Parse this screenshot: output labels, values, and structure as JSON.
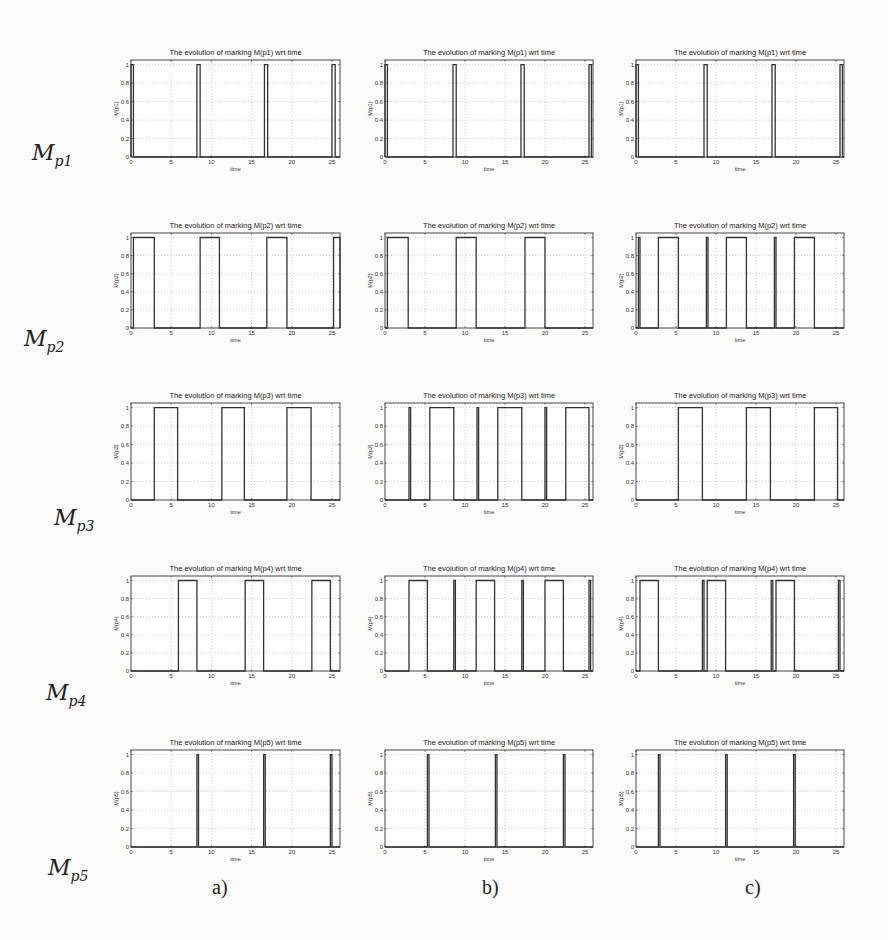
{
  "figure": {
    "row_labels": [
      {
        "base": "M",
        "sub": "p1"
      },
      {
        "base": "M",
        "sub": "p2"
      },
      {
        "base": "M",
        "sub": "p3"
      },
      {
        "base": "M",
        "sub": "p4"
      },
      {
        "base": "M",
        "sub": "p5"
      }
    ],
    "col_labels": [
      "a)",
      "b)",
      "c)"
    ]
  },
  "chart_data": [
    {
      "type": "line",
      "row": 0,
      "col": 0,
      "title": "The evolution of marking M(p1) wrt time",
      "xlabel": "time",
      "ylabel": "M(p1)",
      "xlim": [
        0,
        26
      ],
      "ylim": [
        0,
        1.05
      ],
      "xticks": [
        0,
        5,
        10,
        15,
        20,
        25
      ],
      "xtick_labels": [
        "0",
        "5",
        "10",
        "15",
        "20",
        "25"
      ],
      "yticks": [
        0,
        0.2,
        0.4,
        0.6,
        0.8,
        1
      ],
      "ytick_labels": [
        "0",
        "0.2",
        "0.4",
        "0.6",
        "0.8",
        "1"
      ],
      "grid": true,
      "pulses": [
        [
          0,
          0.3
        ],
        [
          8.2,
          8.6
        ],
        [
          16.6,
          17.0
        ],
        [
          25.0,
          25.4
        ]
      ]
    },
    {
      "type": "line",
      "row": 0,
      "col": 1,
      "title": "The evolution of marking M(p1) wrt time",
      "xlabel": "time",
      "ylabel": "M(p1)",
      "xlim": [
        0,
        26
      ],
      "ylim": [
        0,
        1.05
      ],
      "xticks": [
        0,
        5,
        10,
        15,
        20,
        25
      ],
      "xtick_labels": [
        "0",
        "5",
        "10",
        "15",
        "20",
        "25"
      ],
      "yticks": [
        0,
        0.2,
        0.4,
        0.6,
        0.8,
        1
      ],
      "ytick_labels": [
        "0",
        "0.2",
        "0.4",
        "0.6",
        "0.8",
        "1"
      ],
      "grid": true,
      "pulses": [
        [
          0,
          0.3
        ],
        [
          8.5,
          8.9
        ],
        [
          17.0,
          17.4
        ],
        [
          25.5,
          25.8
        ]
      ]
    },
    {
      "type": "line",
      "row": 0,
      "col": 2,
      "title": "The evolution of marking M(p1) wrt time",
      "xlabel": "time",
      "ylabel": "M(p1)",
      "xlim": [
        0,
        26
      ],
      "ylim": [
        0,
        1.05
      ],
      "xticks": [
        0,
        5,
        10,
        15,
        20,
        25
      ],
      "xtick_labels": [
        "0",
        "5",
        "10",
        "15",
        "20",
        "25"
      ],
      "yticks": [
        0,
        0.2,
        0.4,
        0.6,
        0.8,
        1
      ],
      "ytick_labels": [
        "0",
        "0.2",
        "0.4",
        "0.6",
        "0.8",
        "1"
      ],
      "grid": true,
      "pulses": [
        [
          0,
          0.3
        ],
        [
          8.5,
          8.9
        ],
        [
          17.0,
          17.4
        ],
        [
          25.5,
          25.8
        ]
      ]
    },
    {
      "type": "line",
      "row": 1,
      "col": 0,
      "title": "The evolution of marking M(p2) wrt time",
      "xlabel": "time",
      "ylabel": "M(p2)",
      "xlim": [
        0,
        26
      ],
      "ylim": [
        0,
        1.05
      ],
      "xticks": [
        0,
        5,
        10,
        15,
        20,
        25
      ],
      "xtick_labels": [
        "0",
        "5",
        "10",
        "15",
        "20",
        "25"
      ],
      "yticks": [
        0,
        0.2,
        0.4,
        0.6,
        0.8,
        1
      ],
      "ytick_labels": [
        "0",
        "0.2",
        "0.4",
        "0.6",
        "0.8",
        "1"
      ],
      "grid": true,
      "pulses": [
        [
          0.3,
          2.9
        ],
        [
          8.6,
          11.0
        ],
        [
          16.9,
          19.4
        ],
        [
          25.2,
          26
        ]
      ]
    },
    {
      "type": "line",
      "row": 1,
      "col": 1,
      "title": "The evolution of marking M(p2) wrt time",
      "xlabel": "time",
      "ylabel": "M(p2)",
      "xlim": [
        0,
        26
      ],
      "ylim": [
        0,
        1.05
      ],
      "xticks": [
        0,
        5,
        10,
        15,
        20,
        25
      ],
      "xtick_labels": [
        "0",
        "5",
        "10",
        "15",
        "20",
        "25"
      ],
      "yticks": [
        0,
        0.2,
        0.4,
        0.6,
        0.8,
        1
      ],
      "ytick_labels": [
        "0",
        "0.2",
        "0.4",
        "0.6",
        "0.8",
        "1"
      ],
      "grid": true,
      "pulses": [
        [
          0.3,
          2.9
        ],
        [
          8.9,
          11.4
        ],
        [
          17.5,
          20.0
        ]
      ]
    },
    {
      "type": "line",
      "row": 1,
      "col": 2,
      "title": "The evolution of marking M(p2) wrt time",
      "xlabel": "time",
      "ylabel": "M(p2)",
      "xlim": [
        0,
        26
      ],
      "ylim": [
        0,
        1.05
      ],
      "xticks": [
        0,
        5,
        10,
        15,
        20,
        25
      ],
      "xtick_labels": [
        "0",
        "5",
        "10",
        "15",
        "20",
        "25"
      ],
      "yticks": [
        0,
        0.2,
        0.4,
        0.6,
        0.8,
        1
      ],
      "ytick_labels": [
        "0",
        "0.2",
        "0.4",
        "0.6",
        "0.8",
        "1"
      ],
      "grid": true,
      "pulses": [
        [
          0.3,
          0.5
        ],
        [
          2.8,
          5.3
        ],
        [
          8.8,
          9.0
        ],
        [
          11.3,
          13.8
        ],
        [
          17.3,
          17.5
        ],
        [
          19.8,
          22.3
        ]
      ]
    },
    {
      "type": "line",
      "row": 2,
      "col": 0,
      "title": "The evolution of marking M(p3) wrt time",
      "xlabel": "time",
      "ylabel": "M(p3)",
      "xlim": [
        0,
        26
      ],
      "ylim": [
        0,
        1.05
      ],
      "xticks": [
        0,
        5,
        10,
        15,
        20,
        25
      ],
      "xtick_labels": [
        "0",
        "5",
        "10",
        "15",
        "20",
        "25"
      ],
      "yticks": [
        0,
        0.2,
        0.4,
        0.6,
        0.8,
        1
      ],
      "ytick_labels": [
        "0",
        "0.2",
        "0.4",
        "0.6",
        "0.8",
        "1"
      ],
      "grid": true,
      "pulses": [
        [
          2.9,
          5.8
        ],
        [
          11.3,
          14.1
        ],
        [
          19.4,
          22.4
        ]
      ]
    },
    {
      "type": "line",
      "row": 2,
      "col": 1,
      "title": "The evolution of marking M(p3) wrt time",
      "xlabel": "time",
      "ylabel": "M(p3)",
      "xlim": [
        0,
        26
      ],
      "ylim": [
        0,
        1.05
      ],
      "xticks": [
        0,
        5,
        10,
        15,
        20,
        25
      ],
      "xtick_labels": [
        "0",
        "5",
        "10",
        "15",
        "20",
        "25"
      ],
      "yticks": [
        0,
        0.2,
        0.4,
        0.6,
        0.8,
        1
      ],
      "ytick_labels": [
        "0",
        "0.2",
        "0.4",
        "0.6",
        "0.8",
        "1"
      ],
      "grid": true,
      "pulses": [
        [
          3.0,
          3.2
        ],
        [
          5.6,
          8.6
        ],
        [
          11.5,
          11.7
        ],
        [
          14.1,
          17.1
        ],
        [
          20.0,
          20.2
        ],
        [
          22.6,
          25.5
        ]
      ]
    },
    {
      "type": "line",
      "row": 2,
      "col": 2,
      "title": "The evolution of marking M(p3) wrt time",
      "xlabel": "time",
      "ylabel": "M(p3)",
      "xlim": [
        0,
        26
      ],
      "ylim": [
        0,
        1.05
      ],
      "xticks": [
        0,
        5,
        10,
        15,
        20,
        25
      ],
      "xtick_labels": [
        "0",
        "5",
        "10",
        "15",
        "20",
        "25"
      ],
      "yticks": [
        0,
        0.2,
        0.4,
        0.6,
        0.8,
        1
      ],
      "ytick_labels": [
        "0",
        "0.2",
        "0.4",
        "0.6",
        "0.8",
        "1"
      ],
      "grid": true,
      "pulses": [
        [
          5.3,
          8.3
        ],
        [
          13.8,
          16.8
        ],
        [
          22.3,
          25.2
        ]
      ]
    },
    {
      "type": "line",
      "row": 3,
      "col": 0,
      "title": "The evolution of marking M(p4) wrt time",
      "xlabel": "time",
      "ylabel": "M(p4)",
      "xlim": [
        0,
        26
      ],
      "ylim": [
        0,
        1.05
      ],
      "xticks": [
        0,
        5,
        10,
        15,
        20,
        25
      ],
      "xtick_labels": [
        "0",
        "5",
        "10",
        "15",
        "20",
        "25"
      ],
      "yticks": [
        0,
        0.2,
        0.4,
        0.6,
        0.8,
        1
      ],
      "ytick_labels": [
        "0",
        "0.2",
        "0.4",
        "0.6",
        "0.8",
        "1"
      ],
      "grid": true,
      "pulses": [
        [
          5.9,
          8.2
        ],
        [
          14.2,
          16.5
        ],
        [
          22.5,
          24.8
        ]
      ]
    },
    {
      "type": "line",
      "row": 3,
      "col": 1,
      "title": "The evolution of marking M(p4) wrt time",
      "xlabel": "time",
      "ylabel": "M(p4)",
      "xlim": [
        0,
        26
      ],
      "ylim": [
        0,
        1.05
      ],
      "xticks": [
        0,
        5,
        10,
        15,
        20,
        25
      ],
      "xtick_labels": [
        "0",
        "5",
        "10",
        "15",
        "20",
        "25"
      ],
      "yticks": [
        0,
        0.2,
        0.4,
        0.6,
        0.8,
        1
      ],
      "ytick_labels": [
        "0",
        "0.2",
        "0.4",
        "0.6",
        "0.8",
        "1"
      ],
      "grid": true,
      "pulses": [
        [
          3.0,
          5.3
        ],
        [
          8.6,
          8.8
        ],
        [
          11.4,
          13.7
        ],
        [
          17.1,
          17.3
        ],
        [
          20.0,
          22.3
        ],
        [
          25.5,
          25.7
        ]
      ]
    },
    {
      "type": "line",
      "row": 3,
      "col": 2,
      "title": "The evolution of marking M(p4) wrt time",
      "xlabel": "time",
      "ylabel": "M(p4)",
      "xlim": [
        0,
        26
      ],
      "ylim": [
        0,
        1.05
      ],
      "xticks": [
        0,
        5,
        10,
        15,
        20,
        25
      ],
      "xtick_labels": [
        "0",
        "5",
        "10",
        "15",
        "20",
        "25"
      ],
      "yticks": [
        0,
        0.2,
        0.4,
        0.6,
        0.8,
        1
      ],
      "ytick_labels": [
        "0",
        "0.2",
        "0.4",
        "0.6",
        "0.8",
        "1"
      ],
      "grid": true,
      "pulses": [
        [
          0.5,
          2.8
        ],
        [
          8.3,
          8.5
        ],
        [
          8.9,
          11.2
        ],
        [
          16.9,
          17.1
        ],
        [
          17.5,
          19.8
        ],
        [
          25.3,
          25.5
        ]
      ]
    },
    {
      "type": "line",
      "row": 4,
      "col": 0,
      "title": "The evolution of marking M(p5) wrt time",
      "xlabel": "time",
      "ylabel": "M(p5)",
      "xlim": [
        0,
        26
      ],
      "ylim": [
        0,
        1.05
      ],
      "xticks": [
        0,
        5,
        10,
        15,
        20,
        25
      ],
      "xtick_labels": [
        "0",
        "5",
        "10",
        "15",
        "20",
        "25"
      ],
      "yticks": [
        0,
        0.2,
        0.4,
        0.6,
        0.8,
        1
      ],
      "ytick_labels": [
        "0",
        "0.2",
        "0.4",
        "0.6",
        "0.8",
        "1"
      ],
      "grid": true,
      "pulses": [
        [
          8.2,
          8.4
        ],
        [
          16.5,
          16.7
        ],
        [
          24.8,
          25.0
        ]
      ]
    },
    {
      "type": "line",
      "row": 4,
      "col": 1,
      "title": "The evolution of marking M(p5) wrt time",
      "xlabel": "time",
      "ylabel": "M(p5)",
      "xlim": [
        0,
        26
      ],
      "ylim": [
        0,
        1.05
      ],
      "xticks": [
        0,
        5,
        10,
        15,
        20,
        25
      ],
      "xtick_labels": [
        "0",
        "5",
        "10",
        "15",
        "20",
        "25"
      ],
      "yticks": [
        0,
        0.2,
        0.4,
        0.6,
        0.8,
        1
      ],
      "ytick_labels": [
        "0",
        "0.2",
        "0.4",
        "0.6",
        "0.8",
        "1"
      ],
      "grid": true,
      "pulses": [
        [
          5.3,
          5.5
        ],
        [
          13.8,
          14.0
        ],
        [
          22.3,
          22.5
        ]
      ]
    },
    {
      "type": "line",
      "row": 4,
      "col": 2,
      "title": "The evolution of marking M(p5) wrt time",
      "xlabel": "time",
      "ylabel": "M(p5)",
      "xlim": [
        0,
        26
      ],
      "ylim": [
        0,
        1.05
      ],
      "xticks": [
        0,
        5,
        10,
        15,
        20,
        25
      ],
      "xtick_labels": [
        "0",
        "5",
        "10",
        "15",
        "20",
        "25"
      ],
      "yticks": [
        0,
        0.2,
        0.4,
        0.6,
        0.8,
        1
      ],
      "ytick_labels": [
        "0",
        "0.2",
        "0.4",
        "0.6",
        "0.8",
        "1"
      ],
      "grid": true,
      "pulses": [
        [
          2.8,
          3.0
        ],
        [
          11.2,
          11.4
        ],
        [
          19.7,
          19.9
        ]
      ]
    }
  ]
}
